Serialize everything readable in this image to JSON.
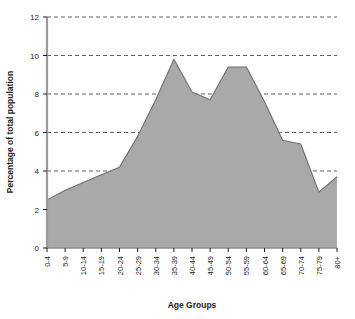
{
  "chart_data": {
    "type": "area",
    "title": "",
    "xlabel": "Age Groups",
    "ylabel": "Percentage of total population",
    "categories": [
      "0-4",
      "5-9",
      "10-14",
      "15-19",
      "20-24",
      "25-29",
      "30-34",
      "35-39",
      "40-44",
      "45-49",
      "50-54",
      "55-59",
      "60-64",
      "65-69",
      "70-74",
      "75-79",
      "80+"
    ],
    "values": [
      2.5,
      3.0,
      3.4,
      3.8,
      4.2,
      5.8,
      7.7,
      9.8,
      8.1,
      7.7,
      9.4,
      9.4,
      7.6,
      5.6,
      5.4,
      2.9,
      3.7
    ],
    "ylim": [
      0,
      12
    ],
    "yticks": [
      0,
      2,
      4,
      6,
      8,
      10,
      12
    ],
    "ytick_labels": [
      "0",
      "2",
      "4",
      "6",
      "8",
      "10",
      "12"
    ],
    "grid": true,
    "grid_style": "dashed",
    "legend": "none",
    "series_fill_color": "#a9a9a9",
    "series_line_color": "#6e6e6e",
    "axis_color": "#999999",
    "grid_color": "#4d4d4d",
    "text_color": "#1a1a1a",
    "background_color": "#ffffff"
  }
}
